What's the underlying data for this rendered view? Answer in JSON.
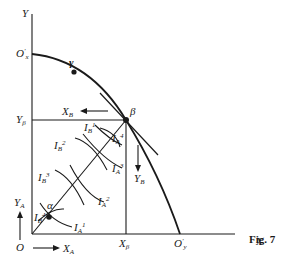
{
  "figure": {
    "caption": "Fig. 7",
    "axes": {
      "y_label": "Y",
      "x_label": "X",
      "origin_label": "O",
      "o_prime_x": "O'x",
      "o_prime_y": "O'y",
      "y_beta": "Yβ",
      "x_beta": "Xβ"
    },
    "points": {
      "alpha": "α",
      "beta": "β",
      "gamma": "γ"
    },
    "arrows": {
      "xa": "XA",
      "ya": "YA",
      "xb": "XB",
      "yb": "YB"
    },
    "indifference_curves": {
      "A": [
        "IA1",
        "IA2",
        "IA3",
        "IA4"
      ],
      "B": [
        "IB1",
        "IB2",
        "IB3",
        "IB4"
      ]
    }
  }
}
